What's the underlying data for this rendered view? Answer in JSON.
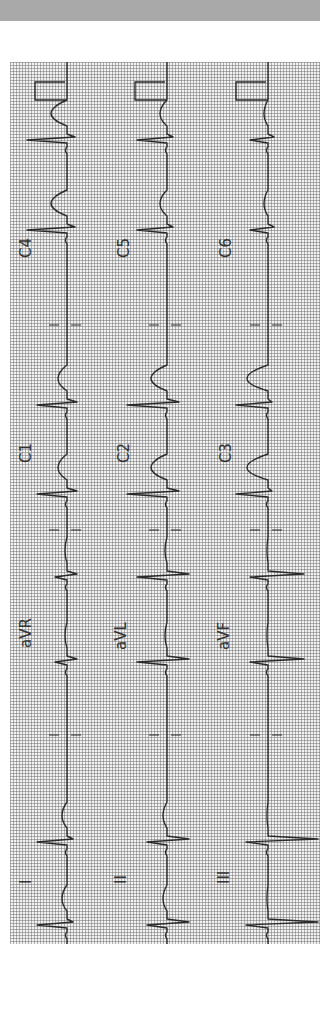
{
  "chart_data": {
    "type": "line",
    "title": "",
    "orientation": "rotated-90-ccw",
    "grid": true,
    "rows": [
      {
        "leads": [
          "I",
          "aVR",
          "C1",
          "C4"
        ]
      },
      {
        "leads": [
          "II",
          "aVL",
          "C2",
          "C5"
        ]
      },
      {
        "leads": [
          "III",
          "aVF",
          "C3",
          "C6"
        ]
      }
    ],
    "columns_x": [
      67,
      167,
      268
    ],
    "label_positions_y": {
      "limb": 873,
      "augmented": 628,
      "chest_a": 448,
      "chest_b": 240
    },
    "lead_segments_y": [
      [
        944,
        735
      ],
      [
        735,
        530
      ],
      [
        530,
        325
      ],
      [
        325,
        62
      ]
    ],
    "beat_times_y": [
      925,
      842,
      752,
      662,
      577,
      494,
      405,
      326,
      230,
      140
    ],
    "beats": {
      "I": {
        "qrs": 30,
        "s": -6,
        "t": 10
      },
      "aVR": {
        "qrs": 12,
        "s": -10,
        "t": 4
      },
      "C1": {
        "qrs": 30,
        "s": -10,
        "t": 18
      },
      "C4": {
        "qrs": 40,
        "s": -8,
        "t": 32
      },
      "II": {
        "qrs": 20,
        "s": -22,
        "t": 8
      },
      "aVL": {
        "qrs": 30,
        "s": -22,
        "t": 4
      },
      "C2": {
        "qrs": 40,
        "s": -12,
        "t": 32
      },
      "C5": {
        "qrs": 30,
        "s": -6,
        "t": 14
      },
      "III": {
        "qrs": 22,
        "s": -50,
        "t": 2
      },
      "aVF": {
        "qrs": 18,
        "s": -36,
        "t": 2
      },
      "C3": {
        "qrs": 32,
        "s": -4,
        "t": 42
      },
      "C6": {
        "qrs": 18,
        "s": -6,
        "t": 8
      }
    },
    "calibration_pulse": {
      "y_top": 82,
      "y_bottom": 100,
      "width": 32
    }
  },
  "labels": {
    "col1": [
      "I",
      "aVR",
      "C1",
      "C4"
    ],
    "col2": [
      "II",
      "aVL",
      "C2",
      "C5"
    ],
    "col3": [
      "III",
      "aVF",
      "C3",
      "C6"
    ]
  },
  "colors": {
    "trace": "#2a2a2a",
    "grid": "#9a9a9a",
    "paper": "#f2f2f2",
    "topbar": "#a9a9a9"
  }
}
